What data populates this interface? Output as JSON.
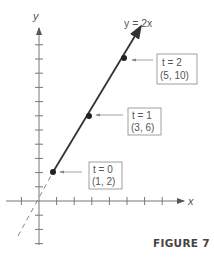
{
  "chart_data": {
    "type": "line",
    "title": "",
    "xlabel": "x",
    "ylabel": "y",
    "line_label": "y = 2x",
    "series": [
      {
        "name": "y = 2x (0 ≤ t ≤ 2)",
        "style": "solid",
        "x": [
          1,
          3,
          5
        ],
        "y": [
          2,
          6,
          10
        ]
      },
      {
        "name": "y = 2x (extension)",
        "style": "dashed",
        "x": [
          -1.2,
          1
        ],
        "y": [
          -2.4,
          2
        ]
      }
    ],
    "points": [
      {
        "t_label": "t = 0",
        "coord_label": "(1, 2)",
        "x": 1,
        "y": 2
      },
      {
        "t_label": "t = 1",
        "coord_label": "(3, 6)",
        "x": 3,
        "y": 6
      },
      {
        "t_label": "t = 2",
        "coord_label": "(5, 10)",
        "x": 5,
        "y": 10
      }
    ],
    "xlim": [
      -2,
      9
    ],
    "ylim": [
      -3,
      12
    ],
    "grid": false,
    "colors": {
      "line": "#333333",
      "axis": "#777777",
      "label": "#555555"
    }
  },
  "caption": "FIGURE 7"
}
